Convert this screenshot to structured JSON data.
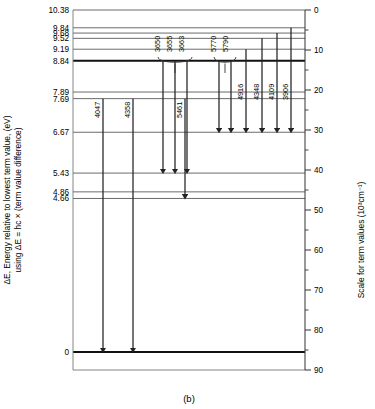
{
  "figure": {
    "caption": "(b)",
    "left_axis_title_line1": "ΔE, Energy relative to lowest term value, (eV)",
    "left_axis_title_line2": "using ΔE = hc × (term value difference)",
    "right_axis_title": "Scale for term values (10³cm⁻¹)"
  },
  "chart_data": {
    "type": "line",
    "xlabel": "",
    "ylabel": "ΔE, Energy relative to lowest term value, (eV)",
    "y2label": "Scale for term values (10³cm⁻¹)",
    "grid": false,
    "legend": "none",
    "ylim_ev": [
      0,
      10.38
    ],
    "y2lim_kk": [
      90,
      0
    ],
    "energy_levels_ev": [
      10.38,
      9.84,
      9.68,
      9.52,
      9.19,
      8.84,
      7.89,
      7.69,
      6.67,
      5.43,
      4.86,
      4.66,
      0
    ],
    "level_labels": [
      "10.38",
      "9.84",
      "9.68",
      "9.52",
      "9.19",
      "8.84",
      "7.89",
      "7.69",
      "6.67",
      "5.43",
      "4.86",
      "4.66",
      "0"
    ],
    "bold_levels_ev": [
      8.84,
      0
    ],
    "right_tick_labels": [
      "0",
      "10",
      "20",
      "30",
      "40",
      "50",
      "60",
      "70",
      "80",
      "90"
    ],
    "right_tick_values_kk": [
      0,
      10,
      20,
      30,
      40,
      50,
      60,
      70,
      80,
      90
    ],
    "right_minor_ticks_kk": [
      5,
      15,
      25,
      35,
      45,
      55,
      65,
      75,
      85
    ],
    "transitions": [
      {
        "label": "4047",
        "from_ev": 7.69,
        "to_ev": 0.0
      },
      {
        "label": "4358",
        "from_ev": 7.69,
        "to_ev": 0.0
      },
      {
        "label": "3650",
        "from_ev": 8.84,
        "to_ev": 5.43
      },
      {
        "label": "3655",
        "from_ev": 8.84,
        "to_ev": 5.43
      },
      {
        "label": "3663",
        "from_ev": 8.84,
        "to_ev": 5.43
      },
      {
        "label": "5461",
        "from_ev": 7.69,
        "to_ev": 4.66
      },
      {
        "label": "5770",
        "from_ev": 8.84,
        "to_ev": 6.67
      },
      {
        "label": "5790",
        "from_ev": 8.84,
        "to_ev": 6.67
      },
      {
        "label": "4916",
        "from_ev": 9.19,
        "to_ev": 6.67
      },
      {
        "label": "4348",
        "from_ev": 9.52,
        "to_ev": 6.67
      },
      {
        "label": "4109",
        "from_ev": 9.68,
        "to_ev": 6.67
      },
      {
        "label": "3906",
        "from_ev": 9.84,
        "to_ev": 6.67
      }
    ],
    "bracket_groups": [
      {
        "labels": [
          "3650",
          "3655",
          "3663"
        ]
      },
      {
        "labels": [
          "5770",
          "5790"
        ]
      }
    ]
  }
}
